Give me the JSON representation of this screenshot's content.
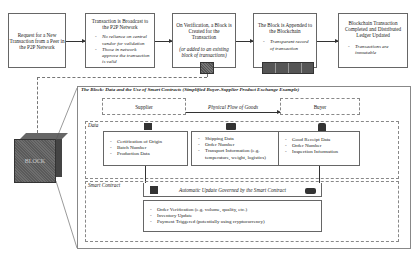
{
  "process_steps": [
    {
      "title": "Request for a New Transaction from a Peer in the P2P Network",
      "bullets": []
    },
    {
      "title": "Transaction is Broadcast to the P2P Network",
      "bullets": [
        "No reliance on central vendor for validation",
        "Those in network approve the transaction is valid"
      ]
    },
    {
      "title": "On Verification, a Block is Created for the Transaction",
      "note": "(or added to an existing block of transactions)",
      "bullets": []
    },
    {
      "title": "The Block is Appended to the Blockchain",
      "bullets": [
        "Transparent record of transaction"
      ]
    },
    {
      "title": "Blockchain Transaction Completed and Distributed Ledger Updated",
      "bullets": [
        "Transactions are immutable"
      ]
    }
  ],
  "block_label": "BLOCK",
  "detail": {
    "title": "The Block: Data and the Use of Smart Contracts (Simplified Buyer-Supplier Product Exchange Example)",
    "supplier": "Supplier",
    "buyer": "Buyer",
    "flow_label": "Physical Flow of Goods",
    "data_label": "Data",
    "data_columns": [
      {
        "icon": "factory-icon",
        "items": [
          "Certification of Origin",
          "Batch Number",
          "Production Data"
        ]
      },
      {
        "icon": "truck-icon",
        "items": [
          "Shipping Data",
          "Order Number",
          "Transport Information (e.g. temperature, weight, logistics)"
        ]
      },
      {
        "icon": "warehouse-icon",
        "items": [
          "Good Receipt Data",
          "Order Number",
          "Inspection Information"
        ]
      }
    ],
    "smart_contract_label": "Smart Contract",
    "auto_update_label": "Automatic Update Governed by the Smart Contract",
    "contract_items": [
      "Order Verification (e.g. volume, quality, etc.)",
      "Inventory Update",
      "Payment Triggered (potentially using cryptocurrency)"
    ]
  }
}
